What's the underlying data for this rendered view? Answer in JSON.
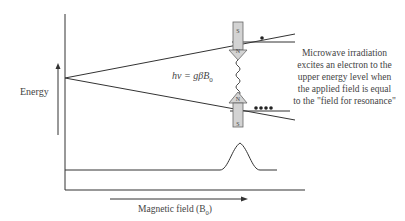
{
  "diagram": {
    "y_axis_label": "Energy",
    "x_axis_label": "Magnetic field (B",
    "x_axis_subscript": "0",
    "x_axis_close": ")",
    "equation": "hν = gβB",
    "equation_subscript": "0",
    "magnet_top": {
      "top_pole": "S",
      "bottom_pole": "N"
    },
    "magnet_bottom": {
      "top_pole": "N",
      "bottom_pole": "S"
    },
    "annotation_lines": [
      "Microwave irradiation",
      "excites an electron to the",
      "upper energy level when",
      "the applied field is equal",
      "to the \"field for resonance\""
    ],
    "upper_level_electrons": 1,
    "lower_level_electrons": 4,
    "colors": {
      "line": "#333333",
      "magnet_fill": "#d3d3d3",
      "magnet_stroke": "#555555"
    }
  }
}
